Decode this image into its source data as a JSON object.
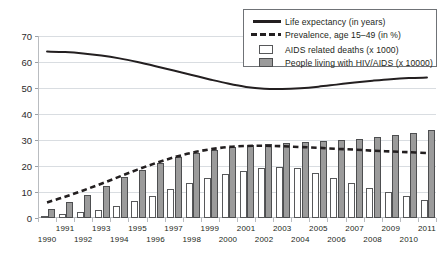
{
  "chart_data": {
    "type": "bar",
    "title": "",
    "subtitle": "",
    "xlabel": "",
    "ylabel": "",
    "ylim": [
      0,
      70
    ],
    "yticks": [
      0,
      10,
      20,
      30,
      40,
      50,
      60,
      70
    ],
    "grid": true,
    "legend_position": "top-right",
    "categories": [
      "1990",
      "1991",
      "1992",
      "1993",
      "1994",
      "1995",
      "1996",
      "1997",
      "1998",
      "1999",
      "2000",
      "2001",
      "2002",
      "2003",
      "2004",
      "2005",
      "2006",
      "2007",
      "2008",
      "2009",
      "2010",
      "2011"
    ],
    "series": [
      {
        "name": "Life expectancy (in years)",
        "type": "line",
        "style": "solid",
        "color": "#231f20",
        "values": [
          64.0,
          63.8,
          63.3,
          62.5,
          61.4,
          60.0,
          58.4,
          56.7,
          55.0,
          53.3,
          51.7,
          50.4,
          49.7,
          49.6,
          49.9,
          50.5,
          51.3,
          52.1,
          52.8,
          53.4,
          53.8,
          54.0
        ]
      },
      {
        "name": "Prevalence, age 15-49 (in %)",
        "type": "line",
        "style": "dashed",
        "color": "#231f20",
        "values": [
          6.0,
          8.2,
          10.6,
          13.2,
          15.9,
          18.6,
          21.1,
          23.3,
          25.1,
          26.4,
          27.3,
          27.7,
          27.8,
          27.6,
          27.3,
          27.0,
          26.6,
          26.3,
          25.9,
          25.6,
          25.3,
          25.0
        ]
      },
      {
        "name": "AIDS related deaths (x 1000)",
        "type": "bar",
        "fill": "#ffffff",
        "border": "#57585a",
        "values": [
          0.8,
          1.4,
          2.2,
          3.2,
          4.6,
          6.4,
          8.6,
          11.0,
          13.4,
          15.4,
          17.0,
          18.2,
          19.2,
          19.6,
          19.3,
          17.3,
          15.3,
          13.3,
          11.6,
          10.0,
          8.4,
          6.8
        ]
      },
      {
        "name": "People living with HIV/AIDS (x 10000)",
        "type": "bar",
        "fill": "#9b9b9b",
        "border": "#4d4e50",
        "values": [
          3.6,
          6.1,
          9.0,
          12.3,
          15.6,
          18.6,
          21.2,
          23.4,
          25.1,
          26.3,
          27.2,
          27.9,
          28.4,
          28.8,
          29.1,
          29.5,
          29.9,
          30.4,
          31.0,
          31.8,
          32.7,
          33.8
        ]
      }
    ],
    "legend": [
      {
        "label": "Life expectancy (in years)",
        "mark": "solid-line"
      },
      {
        "label": "Prevalence, age 15–49 (in %)",
        "mark": "dashed-line"
      },
      {
        "label": "AIDS related deaths (x 1000)",
        "mark": "white-swatch"
      },
      {
        "label": "People living with HIV/AIDS (x 10000)",
        "mark": "gray-swatch"
      }
    ],
    "colors": {
      "line": "#231f20",
      "grid": "#d9dde1",
      "axis": "#b9bcc0",
      "bar_deaths_fill": "#ffffff",
      "bar_deaths_border": "#57585a",
      "bar_plhiv_fill": "#9b9b9b",
      "bar_plhiv_border": "#4d4e50",
      "background": "#ffffff",
      "text": "#231f20"
    }
  }
}
